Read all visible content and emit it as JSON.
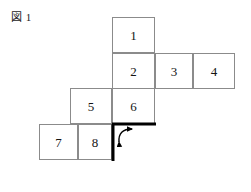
{
  "figure": {
    "caption": "図 1",
    "caption_text_parts": {
      "kanji": "図",
      "number": "1"
    },
    "width_px": 251,
    "height_px": 192,
    "background_color": "#ffffff",
    "cell_border_color": "#8b8b8b",
    "bold_edge_color": "#000000",
    "arrow_color": "#000000",
    "text_color": "#141414"
  },
  "net": {
    "description": "Cube net of eight numbered squares arranged in a staircase",
    "cell_width_px": 43,
    "cell_height_px": 36,
    "cells": [
      {
        "label": "1",
        "name": "cell-1",
        "x": 112,
        "y": 17,
        "w": 43,
        "h": 36
      },
      {
        "label": "2",
        "name": "cell-2",
        "x": 112,
        "y": 53,
        "w": 43,
        "h": 36
      },
      {
        "label": "3",
        "name": "cell-3",
        "x": 155,
        "y": 53,
        "w": 38,
        "h": 36
      },
      {
        "label": "4",
        "name": "cell-4",
        "x": 193,
        "y": 53,
        "w": 42,
        "h": 36
      },
      {
        "label": "5",
        "name": "cell-5",
        "x": 70,
        "y": 88,
        "w": 42,
        "h": 36
      },
      {
        "label": "6",
        "name": "cell-6",
        "x": 112,
        "y": 88,
        "w": 43,
        "h": 36
      },
      {
        "label": "7",
        "name": "cell-7",
        "x": 39,
        "y": 124,
        "w": 39,
        "h": 36
      },
      {
        "label": "8",
        "name": "cell-8",
        "x": 78,
        "y": 124,
        "w": 34,
        "h": 36
      }
    ]
  },
  "fold_marks": {
    "bold_horizontal_edge": {
      "x1": 112,
      "y1": 124,
      "x2": 156,
      "y2": 124,
      "width": 3
    },
    "bold_vertical_edge": {
      "x1": 113,
      "y1": 124,
      "x2": 113,
      "y2": 161,
      "width": 3
    },
    "fold_arrow": {
      "name": "fold-arrow",
      "double_headed": true,
      "from_x": 119,
      "from_y": 142,
      "to_x": 132,
      "to_y": 129,
      "control_x": 118,
      "control_y": 129
    }
  }
}
